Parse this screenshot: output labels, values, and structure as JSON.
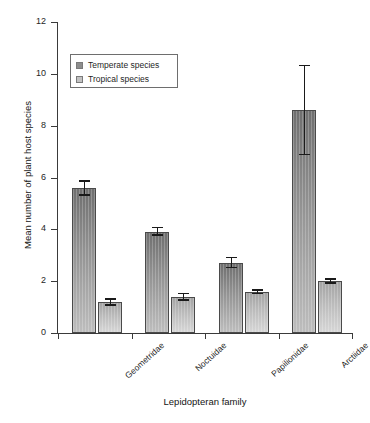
{
  "chart_data": {
    "type": "bar",
    "title": "",
    "xlabel": "Lepidopteran family",
    "ylabel": "Mean number of plant host species",
    "categories": [
      "Geometridae",
      "Noctuidae",
      "Papilionidae",
      "Arctiidae"
    ],
    "ylim": [
      0,
      12
    ],
    "ytick_labels": [
      "0",
      "2",
      "4",
      "6",
      "8",
      "10",
      "12"
    ],
    "yticks": [
      0,
      2,
      4,
      6,
      8,
      10,
      12
    ],
    "grid": false,
    "legend_position": "upper-left-inside",
    "series": [
      {
        "name": "Temperate species",
        "color": "#8d8d8d",
        "values": [
          5.6,
          3.9,
          2.7,
          8.6
        ],
        "errors_low": [
          5.3,
          3.75,
          2.5,
          6.85
        ],
        "errors_high": [
          5.9,
          4.1,
          2.95,
          10.35
        ]
      },
      {
        "name": "Tropical species",
        "color": "#c2c2c2",
        "values": [
          1.2,
          1.4,
          1.6,
          2.0
        ],
        "errors_low": [
          1.05,
          1.25,
          1.5,
          1.9
        ],
        "errors_high": [
          1.35,
          1.55,
          1.7,
          2.12
        ]
      }
    ]
  },
  "legend": {
    "items": [
      {
        "label": "Temperate species",
        "swatch": "temperate"
      },
      {
        "label": "Tropical species",
        "swatch": "tropical"
      }
    ]
  },
  "axes": {
    "y_title": "Mean number of plant host species",
    "x_title": "Lepidopteran family",
    "y_labels": {
      "t0": "0",
      "t2": "2",
      "t4": "4",
      "t6": "6",
      "t8": "8",
      "t10": "10",
      "t12": "12"
    }
  },
  "categories": {
    "c0": "Geometridae",
    "c1": "Noctuidae",
    "c2": "Papilionidae",
    "c3": "Arctiidae"
  },
  "caption": {
    "fragment": ""
  }
}
